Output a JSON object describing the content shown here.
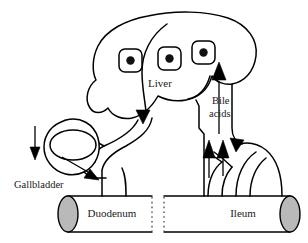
{
  "diagram": {
    "background_color": "#ffffff",
    "stroke_color": "#000000",
    "cap_fill_color": "#b9b9b9",
    "labels": {
      "liver": "Liver",
      "bile_acids_line1": "Bile",
      "bile_acids_line2": "acids",
      "gallbladder": "Gallbladder",
      "duodenum": "Duodenum",
      "ileum": "Ileum"
    },
    "organs": [
      {
        "name": "liver",
        "label": "Liver",
        "hepatocyte_count": 3
      },
      {
        "name": "gallbladder",
        "label": "Gallbladder"
      },
      {
        "name": "duodenum",
        "label": "Duodenum"
      },
      {
        "name": "ileum",
        "label": "Ileum"
      }
    ],
    "flows": [
      {
        "name": "liver-to-duodenum",
        "label": "Bile",
        "direction": "down"
      },
      {
        "name": "liver-to-gallbladder",
        "direction": "up-left"
      },
      {
        "name": "gallbladder-storage",
        "direction": "down"
      },
      {
        "name": "gallbladder-to-duodenum",
        "direction": "down-right"
      },
      {
        "name": "ileum-reabsorption",
        "direction": "up"
      },
      {
        "name": "portal-vein-to-liver",
        "label": "Bile acids",
        "direction": "up"
      }
    ]
  }
}
